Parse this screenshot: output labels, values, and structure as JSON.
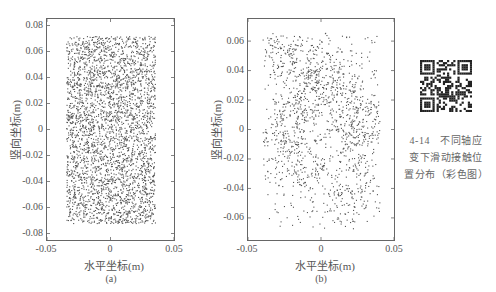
{
  "figure": {
    "caption_lines": [
      "4-14　不同轴应",
      "变下滑动接触位",
      "置分布（彩色图）"
    ],
    "qr_code": "qr-code-icon"
  },
  "chart_data": [
    {
      "type": "scatter",
      "panel": "(a)",
      "title": "",
      "xlabel": "水平坐标(m)",
      "ylabel": "竖向坐标(m)",
      "xlim": [
        -0.05,
        0.05
      ],
      "ylim": [
        -0.085,
        0.085
      ],
      "xticks": [
        "-0.05",
        "0",
        "0.05"
      ],
      "yticks": [
        "0.08",
        "0.06",
        "0.04",
        "0.02",
        "0",
        "-0.02",
        "-0.04",
        "-0.06",
        "-0.08"
      ],
      "grid": false,
      "legend": null,
      "marker_color": "#555555",
      "point_region": {
        "x": [
          -0.035,
          0.035
        ],
        "y": [
          -0.072,
          0.072
        ]
      },
      "point_count": 3200,
      "distribution": "dense, nearly uniform within rectangle"
    },
    {
      "type": "scatter",
      "panel": "(b)",
      "title": "",
      "xlabel": "水平坐标(m)",
      "ylabel": "竖向坐标(m)",
      "xlim": [
        -0.05,
        0.05
      ],
      "ylim": [
        -0.075,
        0.075
      ],
      "xticks": [
        "-0.05",
        "0",
        "0.05"
      ],
      "yticks": [
        "0.06",
        "0.04",
        "0.02",
        "0",
        "-0.02",
        "-0.04",
        "-0.06"
      ],
      "grid": false,
      "legend": null,
      "marker_color": "#555555",
      "point_region": {
        "x": [
          -0.04,
          0.04
        ],
        "y": [
          -0.067,
          0.066
        ]
      },
      "point_count": 1500,
      "distribution": "sparser, clustered with voids"
    }
  ],
  "panels": {
    "a": {
      "label": "(a)",
      "xlabel": "水平坐标(m)",
      "ylabel": "竖向坐标(m)",
      "xticks": [
        "-0.05",
        "0",
        "0.05"
      ],
      "yticks": [
        "0.08",
        "0.06",
        "0.04",
        "0.02",
        "0",
        "-0.02",
        "-0.04",
        "-0.06",
        "-0.08"
      ]
    },
    "b": {
      "label": "(b)",
      "xlabel": "水平坐标(m)",
      "ylabel": "竖向坐标(m)",
      "xticks": [
        "-0.05",
        "0",
        "0.05"
      ],
      "yticks": [
        "0.06",
        "0.04",
        "0.02",
        "0",
        "-0.02",
        "-0.04",
        "-0.06"
      ]
    }
  }
}
